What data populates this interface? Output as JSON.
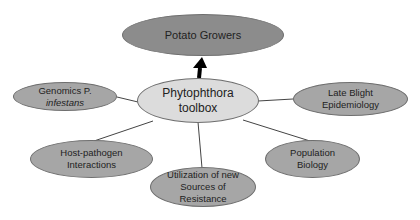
{
  "diagram": {
    "title_node": {
      "label": "Potato Growers"
    },
    "center_node": {
      "line1": "Phytophthora",
      "line2": "toolbox"
    },
    "branches": [
      {
        "id": "genomics",
        "line1": "Genomics P.",
        "line2": "infestans"
      },
      {
        "id": "late-blight",
        "line1": "Late Blight",
        "line2": "Epidemiology"
      },
      {
        "id": "host-pathogen",
        "line1": "Host-pathogen",
        "line2": "Interactions"
      },
      {
        "id": "population",
        "line1": "Population",
        "line2": "Biology"
      },
      {
        "id": "utilization",
        "line1": "Utilization of  new",
        "line2": "Sources of",
        "line3": "Resistance"
      }
    ],
    "arrow": {
      "from": "center_node",
      "to": "title_node"
    }
  },
  "colors": {
    "top_fill": "#8c8c8c",
    "branch_fill": "#a6a6a6",
    "center_fill": "#dcdcdc",
    "edge": "#444444"
  }
}
